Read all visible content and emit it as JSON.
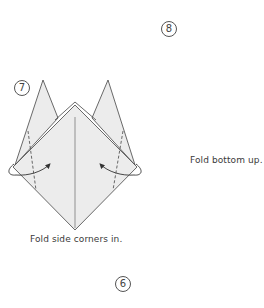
{
  "diagram": {
    "colors": {
      "paper_fill": "#ececec",
      "paper_fill_light": "#f4f4f4",
      "line": "#444444",
      "background": "#ffffff"
    },
    "steps": [
      {
        "number": "7",
        "caption": "Fold side corners in.",
        "fold_lines": "dashed valley folds on left and right sides",
        "arrows": "curved arrows folding left and right corners inward"
      },
      {
        "number": "8",
        "caption": "Fold bottom up.",
        "fold_lines": "horizontal dashed valley fold",
        "arrows": "curved arrow from bottom point up to top"
      },
      {
        "number": "6",
        "caption": "",
        "symbol": "turn-over-icon"
      }
    ],
    "turn_over_symbol": "turn model over"
  }
}
